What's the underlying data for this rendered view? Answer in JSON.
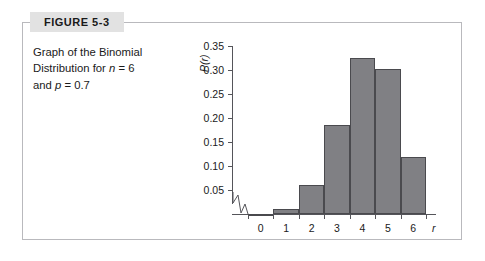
{
  "figure": {
    "label": "FIGURE 5-3",
    "caption_line1": "Graph of the Binomial",
    "caption_line2_pre": "Distribution for ",
    "caption_line2_var": "n",
    "caption_line2_post": " = 6",
    "caption_line3_pre": "and ",
    "caption_line3_var": "p",
    "caption_line3_post": " = 0.7"
  },
  "colors": {
    "bar_fill": "#808084",
    "bar_edge": "#4a4a4e",
    "frame": "#b9b9bd",
    "label_band": "#e2e2e2",
    "axis": "#55555a",
    "background": "#ffffff"
  },
  "chart_data": {
    "type": "bar",
    "title": "",
    "xlabel": "r",
    "ylabel": "P(r)",
    "categories": [
      "0",
      "1",
      "2",
      "3",
      "4",
      "5",
      "6"
    ],
    "values": [
      0.001,
      0.01,
      0.06,
      0.185,
      0.324,
      0.303,
      0.118
    ],
    "ylim": [
      0,
      0.35
    ],
    "ytick_labels": [
      "0.05",
      "0.10",
      "0.15",
      "0.20",
      "0.25",
      "0.30",
      "0.35"
    ],
    "ytick_values": [
      0.05,
      0.1,
      0.15,
      0.2,
      0.25,
      0.3,
      0.35
    ],
    "xtick_labels": [
      "0",
      "1",
      "2",
      "3",
      "4",
      "5",
      "6"
    ],
    "grid": false,
    "legend": "none",
    "axis_break": "zigzag-on-x-axis-left-of-zero"
  }
}
